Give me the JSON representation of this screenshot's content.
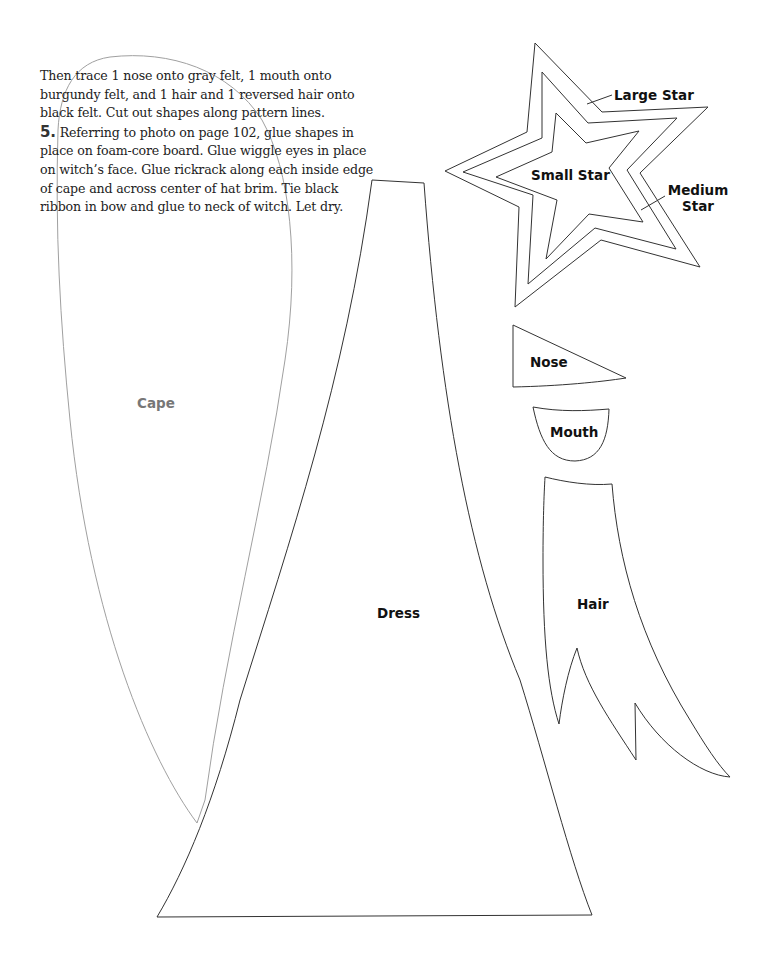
{
  "document": {
    "instructions": {
      "continuation": "Then trace 1 nose onto gray felt, 1 mouth onto burgundy felt, and 1 hair and 1 reversed hair onto black felt. Cut out shapes along pattern lines.",
      "step_number": "5.",
      "step_text": "Referring to photo on page 102, glue shapes in place on foam-core board. Glue wiggle eyes in place on witch’s face. Glue rickrack along each inside edge of cape and across center of hat brim. Tie black ribbon in bow and glue to neck of witch. Let dry."
    },
    "pattern_labels": {
      "large_star": "Large Star",
      "medium_star_line1": "Medium",
      "medium_star_line2": "Star",
      "small_star": "Small Star",
      "nose": "Nose",
      "mouth": "Mouth",
      "hair": "Hair",
      "dress": "Dress",
      "cape": "Cape"
    },
    "colors": {
      "outline": "#333333",
      "cape_outline": "#9a9a9a",
      "cape_label": "#777777",
      "text": "#222222"
    }
  }
}
